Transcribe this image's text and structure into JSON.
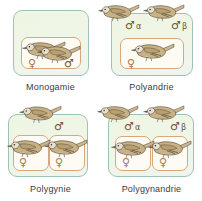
{
  "figure": {
    "background_color": "#ffffff",
    "territory_color": "#eef5e2",
    "territory_border_color": "#9ec3b4",
    "nest_color": "#fdfbf4",
    "nest_border_color": "#d9a87a",
    "bird_body_color": "#c8b083",
    "bird_belly_color": "#f4efe2",
    "bird_outline_color": "#4a4336"
  },
  "symbols": {
    "female": "♀",
    "male": "♂",
    "alpha": "α",
    "beta": "β"
  },
  "panels": [
    {
      "id": "monogamy",
      "caption": "Monogamie",
      "males": 1,
      "females": 1,
      "nests": 1,
      "male_labels": [
        "♂"
      ],
      "female_labels": [
        "♀"
      ]
    },
    {
      "id": "polyandry",
      "caption": "Polyandrie",
      "males": 2,
      "females": 1,
      "nests": 1,
      "male_labels": [
        "♂",
        "♂"
      ],
      "male_greek": [
        "α",
        "β"
      ],
      "female_labels": [
        "♀"
      ]
    },
    {
      "id": "polygyny",
      "caption": "Polygynie",
      "males": 1,
      "females": 2,
      "nests": 2,
      "male_labels": [
        "♂"
      ],
      "female_labels": [
        "♀",
        "♀"
      ]
    },
    {
      "id": "polygynandry",
      "caption": "Polygynandrie",
      "males": 2,
      "females": 2,
      "nests": 2,
      "male_labels": [
        "♂",
        "♂"
      ],
      "male_greek": [
        "α",
        "β"
      ],
      "female_labels": [
        "♀",
        "♀"
      ]
    }
  ]
}
